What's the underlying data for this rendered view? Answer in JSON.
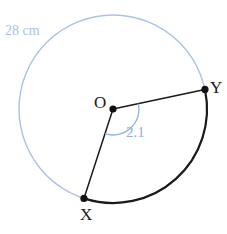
{
  "figure": {
    "background_color": "#ffffff",
    "colors": {
      "circle_outline": "#a9c2e8",
      "sector_arc": "#1a1a1a",
      "radius_line": "#1a1a1a",
      "angle_arc": "#8fb0de",
      "vertex_dot": "#111111",
      "measure_text": "#8fb0de",
      "radius_text": "#a9bfe3",
      "vertex_text": "#1a1a1a"
    },
    "labels": {
      "center": "O",
      "point_x": "X",
      "point_y": "Y",
      "angle": "2.1",
      "circumference": "28 cm"
    },
    "geometry": {
      "center_x": 113,
      "center_y": 109,
      "radius": 94,
      "angle_radians": 2.1,
      "circumference_cm": 28,
      "point_y_angle_deg": -12,
      "point_x_angle_deg": 108,
      "angle_marker_radius": 26
    },
    "icons": {
      "center_dot": "point-marker",
      "x_dot": "point-marker",
      "y_dot": "point-marker"
    }
  }
}
